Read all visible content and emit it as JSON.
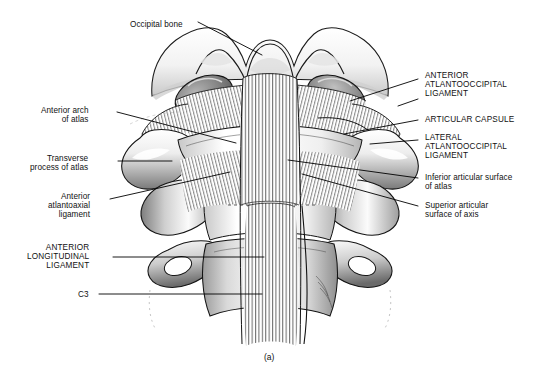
{
  "figure": {
    "caption": "(a)",
    "colors": {
      "ink": "#000000",
      "background": "#ffffff",
      "shade_light": "#d8d8d8",
      "shade_mid": "#9a9a9a",
      "shade_dark": "#4a4a4a",
      "leader_line": "#000000"
    }
  },
  "labels": {
    "top": [
      {
        "id": "occipital-bone",
        "text": "Occipital bone",
        "align": "left",
        "x": 130,
        "y": 20
      }
    ],
    "left": [
      {
        "id": "anterior-arch-of-atlas",
        "text": "Anterior arch\nof atlas",
        "x": 41,
        "y": 106
      },
      {
        "id": "transverse-process-of-atlas",
        "text": "Transverse\nprocess of atlas",
        "x": 30,
        "y": 154
      },
      {
        "id": "anterior-atlantoaxial-ligament",
        "text": "Anterior\natlantoaxial\nligament",
        "x": 48,
        "y": 192
      },
      {
        "id": "anterior-longitudinal-ligament",
        "text": "ANTERIOR\nLONGITUDINAL\nLIGAMENT",
        "x": 27,
        "y": 243
      },
      {
        "id": "c3",
        "text": "C3",
        "x": 78,
        "y": 290
      }
    ],
    "right": [
      {
        "id": "anterior-atlantooccipital-ligament",
        "text": "ANTERIOR\nATLANTOOCCIPITAL\nLIGAMENT",
        "x": 425,
        "y": 71
      },
      {
        "id": "articular-capsule",
        "text": "ARTICULAR CAPSULE",
        "x": 425,
        "y": 115
      },
      {
        "id": "lateral-atlantooccipital-ligament",
        "text": "LATERAL\nATLANTOOCCIPITAL\nLIGAMENT",
        "x": 425,
        "y": 133
      },
      {
        "id": "inferior-articular-surface-of-atlas",
        "text": "Inferior articular surface\nof atlas",
        "x": 425,
        "y": 173
      },
      {
        "id": "superior-articular-surface-of-axis",
        "text": "Superior articular\nsurface of axis",
        "x": 425,
        "y": 201
      }
    ]
  },
  "anatomy": {
    "structures": [
      "occipital bone",
      "occipital condyle (left)",
      "occipital condyle (right)",
      "anterior atlantooccipital ligament",
      "lateral atlantooccipital ligament",
      "articular capsule",
      "anterior arch of atlas",
      "transverse process of atlas (left)",
      "transverse process of atlas (right)",
      "inferior articular surface of atlas",
      "superior articular surface of axis",
      "anterior atlantoaxial ligament",
      "anterior longitudinal ligament",
      "body of axis (C2)",
      "body of C3",
      "transverse process of C3"
    ]
  }
}
